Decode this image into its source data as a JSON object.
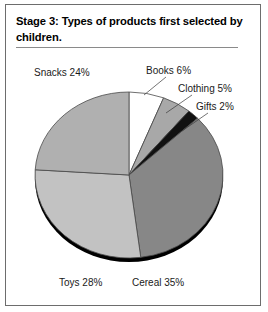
{
  "figure": {
    "title": "Stage 3: Types of products first selected by children."
  },
  "chart_data": {
    "type": "pie",
    "title": "Stage 3: Types of products first selected by children.",
    "xlabel": "",
    "ylabel": "",
    "units": "percent",
    "total": 100,
    "legend_position": "around-slices",
    "grid": false,
    "categories": [
      "Cereal",
      "Toys",
      "Snacks",
      "Books",
      "Clothing",
      "Gifts"
    ],
    "values": [
      35,
      28,
      24,
      6,
      5,
      2
    ],
    "labels": [
      "Cereal 35%",
      "Toys 28%",
      "Snacks 24%",
      "Books 6%",
      "Clothing 5%",
      "Gifts 2%"
    ],
    "slices": [
      {
        "name": "Books",
        "value": 6,
        "label": "Books 6%",
        "color": "#ffffff"
      },
      {
        "name": "Clothing",
        "value": 5,
        "label": "Clothing 5%",
        "color": "#a8a8a8"
      },
      {
        "name": "Gifts",
        "value": 2,
        "label": "Gifts 2%",
        "color": "#111111"
      },
      {
        "name": "Cereal",
        "value": 35,
        "label": "Cereal 35%",
        "color": "#878787"
      },
      {
        "name": "Toys",
        "value": 28,
        "label": "Toys 28%",
        "color": "#c2c2c2"
      },
      {
        "name": "Snacks",
        "value": 24,
        "label": "Snacks 24%",
        "color": "#b0b0b0"
      }
    ]
  },
  "colors": {
    "border": "#6d6d6d",
    "title_rule": "#8a8a8a",
    "slice_outline": "#4a4a4a",
    "shadow": "#000000",
    "text": "#1a1a1a",
    "background": "#ffffff"
  }
}
